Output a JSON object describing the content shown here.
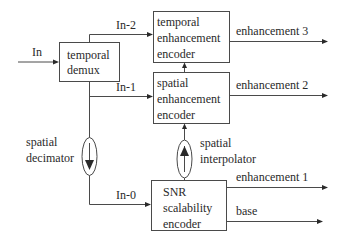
{
  "diagram": {
    "input": {
      "label": "In"
    },
    "blocks": {
      "temporal_demux": {
        "line1": "temporal",
        "line2": "demux"
      },
      "temporal_enhancement_encoder": {
        "line1": "temporal",
        "line2": "enhancement",
        "line3": "encoder"
      },
      "spatial_enhancement_encoder": {
        "line1": "spatial",
        "line2": "enhancement",
        "line3": "encoder"
      },
      "snr_scalability_encoder": {
        "line1": "SNR",
        "line2": "scalability",
        "line3": "encoder"
      }
    },
    "operators": {
      "spatial_decimator": {
        "line1": "spatial",
        "line2": "decimator",
        "direction": "down"
      },
      "spatial_interpolator": {
        "line1": "spatial",
        "line2": "interpolator",
        "direction": "up"
      }
    },
    "signals": {
      "in_2": "In-2",
      "in_1": "In-1",
      "in_0": "In-0"
    },
    "outputs": {
      "enhancement_3": "enhancement 3",
      "enhancement_2": "enhancement 2",
      "enhancement_1": "enhancement 1",
      "base": "base"
    },
    "colors": {
      "stroke": "#4a4a4a",
      "text": "#2a2a2a",
      "background": "#ffffff"
    }
  }
}
